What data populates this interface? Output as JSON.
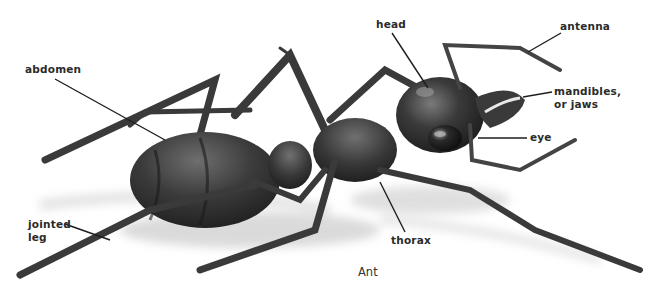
{
  "figure": {
    "caption": "Ant",
    "subject": "ant",
    "colors": {
      "ink": "#2b2b2b",
      "body_dark": "#2e2e2e",
      "body_mid": "#555555",
      "shadow": "#cfcfcf",
      "background": "#ffffff"
    }
  },
  "labels": {
    "head": "head",
    "antenna": "antenna",
    "mandibles_line1": "mandibles,",
    "mandibles_line2": "or jaws",
    "eye": "eye",
    "abdomen": "abdomen",
    "jointed_leg_line1": "jointed",
    "jointed_leg_line2": "leg",
    "thorax": "thorax"
  }
}
